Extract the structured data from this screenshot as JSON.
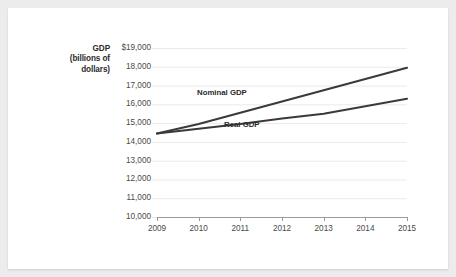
{
  "figure": {
    "background": "#ffffff",
    "page_background": "#ececed"
  },
  "axis": {
    "y_title_lines": [
      "GDP",
      "(billions of",
      "dollars)"
    ],
    "y_ticks": [
      "$19,000",
      "18,000",
      "17,000",
      "16,000",
      "15,000",
      "14,000",
      "13,000",
      "12,000",
      "11,000",
      "10,000"
    ],
    "x_ticks": [
      "2009",
      "2010",
      "2011",
      "2012",
      "2013",
      "2014",
      "2015"
    ]
  },
  "annotations": {
    "nominal_label": "Nominal GDP",
    "real_label": "Real GDP"
  },
  "colors": {
    "line": "#3a3a3a",
    "grid": "#eaeaea",
    "axis": "#9a9a9a",
    "tick_text": "#4a4a4a",
    "title_text": "#2b2b2b"
  },
  "chart_data": {
    "type": "line",
    "title": "",
    "xlabel": "",
    "ylabel": "GDP (billions of dollars)",
    "x": [
      2009,
      2010,
      2011,
      2012,
      2013,
      2014,
      2015
    ],
    "categories": [
      "2009",
      "2010",
      "2011",
      "2012",
      "2013",
      "2014",
      "2015"
    ],
    "series": [
      {
        "name": "Nominal GDP",
        "values": [
          14450,
          14950,
          15550,
          16150,
          16750,
          17350,
          17950
        ]
      },
      {
        "name": "Real GDP",
        "values": [
          14450,
          14700,
          14950,
          15250,
          15500,
          15900,
          16300
        ]
      }
    ],
    "ylim": [
      10000,
      19000
    ],
    "ytick_step": 1000,
    "xlim": [
      2009,
      2015
    ],
    "grid": true,
    "grid_axis": "y",
    "legend": "inline-annotations"
  }
}
